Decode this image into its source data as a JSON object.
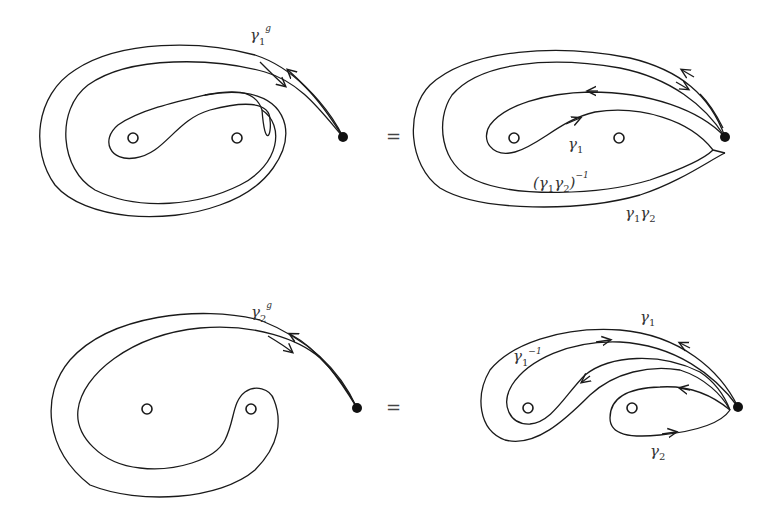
{
  "diagram": {
    "type": "braid-monodromy-loops",
    "panels": [
      {
        "id": "top-left",
        "label": {
          "base": "γ",
          "sub": "1",
          "sup": "g"
        },
        "punctures": 2,
        "has_basepoint": true
      },
      {
        "id": "top-right",
        "labels": [
          {
            "base": "γ",
            "sub": "1"
          },
          {
            "text": "(γ₁γ₂)",
            "sup": "−1"
          },
          {
            "text": "γ₁γ₂"
          }
        ],
        "punctures": 2,
        "has_basepoint": true
      },
      {
        "id": "bottom-left",
        "label": {
          "base": "γ",
          "sub": "2",
          "sup": "g"
        },
        "punctures": 2,
        "has_basepoint": true
      },
      {
        "id": "bottom-right",
        "labels": [
          {
            "base": "γ",
            "sub": "1"
          },
          {
            "base": "γ",
            "sub": "1",
            "sup": "−1"
          },
          {
            "base": "γ",
            "sub": "2"
          }
        ],
        "punctures": 2,
        "has_basepoint": true
      }
    ],
    "equals_sign": "="
  },
  "text": {
    "gamma": "γ",
    "one": "1",
    "two": "2",
    "g": "g",
    "minus_one": "−1",
    "open_paren": "(",
    "close_paren": ")",
    "equals": "="
  }
}
